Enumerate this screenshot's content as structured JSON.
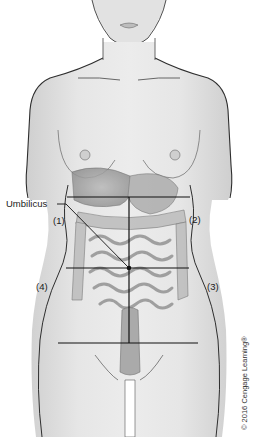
{
  "figure": {
    "labels": {
      "umbilicus": "Umbilicus",
      "q1": "(1)",
      "q2": "(2)",
      "q3": "(3)",
      "q4": "(4)"
    },
    "copyright": "© 2016 Cengage Learning®"
  }
}
